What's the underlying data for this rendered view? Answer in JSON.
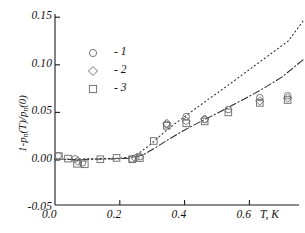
{
  "figure": {
    "background": "#ffffff",
    "ink": "#1b1b1b",
    "marker_color": "#6f6f6f"
  },
  "axes": {
    "x": {
      "title": "T, K",
      "min": -0.02,
      "max": 0.77,
      "ticks": [
        0.0,
        0.2,
        0.4,
        0.6
      ],
      "tick_labels": [
        "0.0",
        "0.2",
        "0.4",
        "0.6"
      ]
    },
    "y": {
      "title_parts": {
        "lead": "1-p",
        "sub1": "n",
        "mid": "(T)/p",
        "sub2": "n",
        "tail": "(0)"
      },
      "title_plain": "1-pn(T)/pn(0)",
      "min": -0.05,
      "max": 0.157,
      "ticks": [
        -0.05,
        0.0,
        0.05,
        0.1,
        0.15
      ],
      "tick_labels": [
        "-0.05",
        "0.00",
        "0.05",
        "0.10",
        "0.15"
      ]
    }
  },
  "legend": {
    "entries": [
      {
        "marker": "circle",
        "label": "- 1"
      },
      {
        "marker": "diamond",
        "label": "- 2"
      },
      {
        "marker": "square",
        "label": "- 3"
      }
    ]
  },
  "chart_data": {
    "type": "scatter",
    "title": "",
    "xlabel": "T, K",
    "ylabel": "1-pn(T)/pn(0)",
    "xlim": [
      -0.02,
      0.77
    ],
    "ylim": [
      -0.05,
      0.157
    ],
    "grid": false,
    "legend_position": "upper-left-inside",
    "series": [
      {
        "name": "1",
        "marker": "circle",
        "points": [
          [
            0.01,
            0.0045
          ],
          [
            0.062,
            0.0012
          ],
          [
            0.085,
            -0.003
          ],
          [
            0.238,
            0.001
          ],
          [
            0.262,
            0.0035
          ],
          [
            0.345,
            0.0375
          ],
          [
            0.405,
            0.0455
          ],
          [
            0.462,
            0.0425
          ],
          [
            0.535,
            0.053
          ],
          [
            0.632,
            0.0655
          ],
          [
            0.718,
            0.0675
          ]
        ]
      },
      {
        "name": "2",
        "marker": "diamond",
        "points": [
          [
            0.07,
            -0.0012
          ],
          [
            0.248,
            0.0018
          ],
          [
            0.345,
            0.0385
          ],
          [
            0.405,
            0.041
          ],
          [
            0.462,
            0.043
          ],
          [
            0.632,
            0.062
          ],
          [
            0.718,
            0.065
          ]
        ]
      },
      {
        "name": "3",
        "marker": "square",
        "points": [
          [
            0.012,
            0.004
          ],
          [
            0.04,
            0.0015
          ],
          [
            0.068,
            -0.004
          ],
          [
            0.092,
            -0.0045
          ],
          [
            0.14,
            0.0008
          ],
          [
            0.19,
            0.0022
          ],
          [
            0.238,
            0.0008
          ],
          [
            0.262,
            0.002
          ],
          [
            0.305,
            0.02
          ],
          [
            0.345,
            0.036
          ],
          [
            0.405,
            0.0385
          ],
          [
            0.462,
            0.0405
          ],
          [
            0.535,
            0.05
          ],
          [
            0.632,
            0.06
          ],
          [
            0.718,
            0.063
          ]
        ]
      }
    ],
    "curves": [
      {
        "name": "dotted-model",
        "style": "dotted",
        "points": [
          [
            0.0,
            0.001
          ],
          [
            0.05,
            0.001
          ],
          [
            0.1,
            0.0012
          ],
          [
            0.15,
            0.0015
          ],
          [
            0.2,
            0.002
          ],
          [
            0.23,
            0.003
          ],
          [
            0.26,
            0.0075
          ],
          [
            0.29,
            0.015
          ],
          [
            0.32,
            0.024
          ],
          [
            0.35,
            0.033
          ],
          [
            0.39,
            0.043
          ],
          [
            0.43,
            0.053
          ],
          [
            0.47,
            0.063
          ],
          [
            0.52,
            0.075
          ],
          [
            0.57,
            0.0875
          ],
          [
            0.62,
            0.1
          ],
          [
            0.67,
            0.1125
          ],
          [
            0.72,
            0.125
          ],
          [
            0.77,
            0.148
          ]
        ]
      },
      {
        "name": "dash-dot-model",
        "style": "dash-dot",
        "points": [
          [
            0.0,
            0.0005
          ],
          [
            0.06,
            0.0005
          ],
          [
            0.12,
            0.0008
          ],
          [
            0.18,
            0.0012
          ],
          [
            0.23,
            0.0018
          ],
          [
            0.27,
            0.005
          ],
          [
            0.31,
            0.013
          ],
          [
            0.35,
            0.0215
          ],
          [
            0.4,
            0.0315
          ],
          [
            0.45,
            0.0405
          ],
          [
            0.5,
            0.049
          ],
          [
            0.55,
            0.058
          ],
          [
            0.6,
            0.067
          ],
          [
            0.65,
            0.0765
          ],
          [
            0.7,
            0.087
          ],
          [
            0.77,
            0.1065
          ]
        ]
      }
    ]
  }
}
